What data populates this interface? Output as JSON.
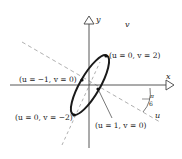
{
  "diagram": {
    "axes": {
      "x_label": "x",
      "y_label": "y"
    },
    "rotated_axes": {
      "u_label": "u",
      "v_label": "v"
    },
    "angle_label": {
      "numerator": "π",
      "denominator": "6"
    },
    "points": [
      {
        "label": "(u = 0, v = 2)"
      },
      {
        "label": "(u = −1, v = 0)"
      },
      {
        "label": "(u = 0, v = −2)"
      },
      {
        "label": "(u = 1, v = 0)"
      }
    ],
    "colors": {
      "ellipse": "#1a1a1a",
      "axes": "#333333",
      "dashed": "#aaaaaa"
    }
  }
}
